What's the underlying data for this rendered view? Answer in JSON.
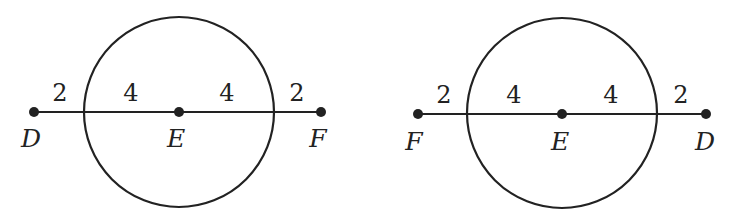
{
  "diagrams": [
    {
      "name": "left",
      "circle": {
        "cx": 179,
        "cy": 112,
        "r": 95
      },
      "line_y": 112,
      "points": [
        {
          "label": "D",
          "x": 34
        },
        {
          "label": "E",
          "x": 179
        },
        {
          "label": "F",
          "x": 321
        }
      ],
      "segments": [
        {
          "text": "2",
          "x": 60
        },
        {
          "text": "4",
          "x": 131
        },
        {
          "text": "4",
          "x": 227
        },
        {
          "text": "2",
          "x": 297
        }
      ]
    },
    {
      "name": "right",
      "circle": {
        "cx": 562,
        "cy": 113,
        "r": 95
      },
      "line_y": 114,
      "points": [
        {
          "label": "F",
          "x": 418
        },
        {
          "label": "E",
          "x": 562
        },
        {
          "label": "D",
          "x": 706
        }
      ],
      "segments": [
        {
          "text": "2",
          "x": 444
        },
        {
          "text": "4",
          "x": 514
        },
        {
          "text": "4",
          "x": 611
        },
        {
          "text": "2",
          "x": 681
        }
      ]
    }
  ],
  "colors": {
    "stroke": "#222222",
    "background": "#ffffff"
  }
}
